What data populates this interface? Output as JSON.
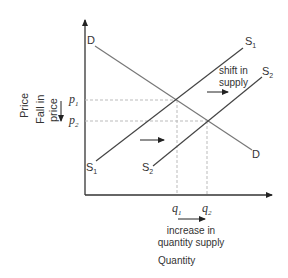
{
  "diagram": {
    "type": "supply-demand",
    "y_axis_label": "Price",
    "x_axis_label": "Quantity",
    "price_change_label": [
      "Fall in",
      "price"
    ],
    "quantity_change_label": [
      "increase in",
      "quantity supply"
    ],
    "shift_label": [
      "shift in",
      "supply"
    ],
    "curves": {
      "demand": {
        "label": "D"
      },
      "supply1": {
        "label": "S",
        "sub": "1"
      },
      "supply2": {
        "label": "S",
        "sub": "2"
      }
    },
    "price_levels": {
      "p1": {
        "label": "p",
        "sub": "1"
      },
      "p2": {
        "label": "p",
        "sub": "2"
      }
    },
    "quantity_levels": {
      "q1": {
        "label": "q",
        "sub": "1"
      },
      "q2": {
        "label": "q",
        "sub": "2"
      }
    },
    "colors": {
      "axis": "#333333",
      "demand": "#777777",
      "supply": "#444444",
      "guide": "#bbbbbb"
    }
  }
}
